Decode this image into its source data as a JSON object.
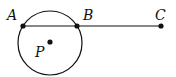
{
  "diagram": {
    "labels": {
      "a": "A",
      "b": "B",
      "c": "C",
      "p": "P"
    },
    "points": {
      "A": [
        23,
        26
      ],
      "B": [
        77,
        26
      ],
      "C": [
        161,
        26
      ],
      "P": [
        50,
        42
      ]
    },
    "circle": {
      "center": [
        50,
        43
      ],
      "radius": 32
    },
    "colors": {
      "stroke": "#111111",
      "background": "#ffffff"
    }
  }
}
